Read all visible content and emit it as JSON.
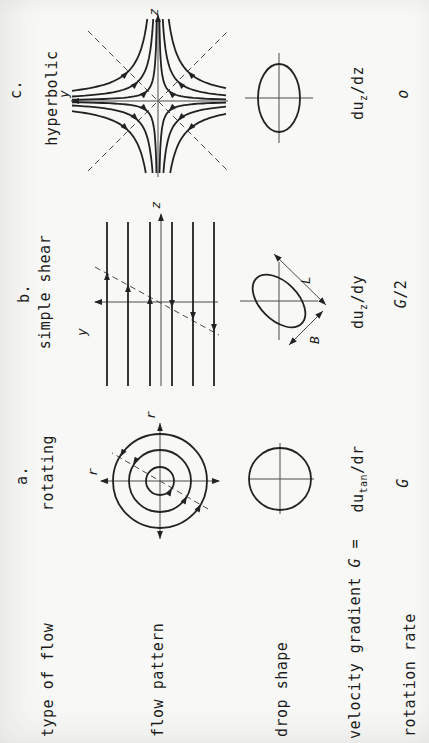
{
  "figure": {
    "row_labels": {
      "type_of_flow": "type of flow",
      "flow_pattern": "flow pattern",
      "drop_shape": "drop shape",
      "velocity_gradient_pre": "velocity gradient",
      "velocity_gradient_symbol": "G",
      "velocity_gradient_eq": "=",
      "rotation_rate": "rotation rate"
    },
    "columns": [
      {
        "letter": "a.",
        "name": "rotating",
        "axis_labels": {
          "top": "r",
          "right": "r"
        },
        "gradient": {
          "base": "du",
          "sub": "tan",
          "rest": "/dr"
        },
        "rate": {
          "symbol": "G",
          "rest": ""
        }
      },
      {
        "letter": "b.",
        "name": "simple shear",
        "axis_labels": {
          "horizontal": "z",
          "vertical": "y"
        },
        "drop_dimensions": {
          "major": "L",
          "minor": "B"
        },
        "gradient": {
          "base": "du",
          "sub": "z",
          "rest": "/dy"
        },
        "rate": {
          "symbol": "G",
          "rest": "/2"
        }
      },
      {
        "letter": "c.",
        "name": "hyperbolic",
        "axis_labels": {
          "horizontal": "z",
          "vertical": "y"
        },
        "gradient": {
          "base": "du",
          "sub": "z",
          "rest": "/dz"
        },
        "rate": {
          "symbol": "o",
          "rest": ""
        }
      }
    ],
    "colors": {
      "ink": "#1b1b1b",
      "stream": "#222222",
      "thin": "#4a4a4a",
      "background": "#f8f8f6"
    }
  }
}
